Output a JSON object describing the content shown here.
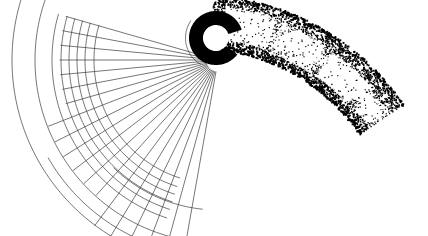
{
  "figure": {
    "title": "Curved grid and stippled band diagram",
    "canvas": {
      "width": 428,
      "height": 236,
      "background": "#ffffff"
    },
    "caption": "",
    "palette": {
      "ink": "#000000",
      "line": "#3b3b3b",
      "background": "#ffffff",
      "stipple": "#000000"
    }
  },
  "annulus": {
    "name": "black ring with gap",
    "center_x": 216,
    "center_y": 38,
    "outer_radius": 27,
    "inner_radius": 13,
    "gap_start_deg": -18,
    "gap_end_deg": 38,
    "fill": "#000000",
    "hole_fill": "#ffffff"
  },
  "grid": {
    "name": "polar mesh of arcs and radial lines",
    "center_x": 218,
    "center_y": 60,
    "arc_radii": [
      124,
      133,
      141,
      149,
      157,
      166,
      183,
      206
    ],
    "arc_start_deg": 108,
    "arc_end_deg": 196,
    "radial_count": 19,
    "radial_start_deg": 100,
    "radial_end_deg": 196,
    "radial_inner_radius": 8,
    "radial_outer_radius": 208,
    "stroke": "#3b3b3b",
    "stroke_width": 0.7
  },
  "band": {
    "name": "stippled curved band",
    "center_x": 196,
    "center_y": 244,
    "inner_radius": 196,
    "outer_radius": 250,
    "start_deg": -86,
    "end_deg": -34,
    "dot_count": 5200,
    "dot_min_size": 0.8,
    "dot_max_size": 1.9,
    "edge_density_boost": 2.4,
    "panels": [
      {
        "label": "panel-1",
        "a0": -82.5,
        "a1": -70.5,
        "r0": 0.2,
        "r1": 0.78
      },
      {
        "label": "panel-2",
        "a0": -68.5,
        "a1": -57.0,
        "r0": 0.18,
        "r1": 0.74
      },
      {
        "label": "panel-3",
        "a0": -54.5,
        "a1": -43.0,
        "r0": 0.2,
        "r1": 0.72
      },
      {
        "label": "panel-4",
        "a0": -41.0,
        "a1": -35.5,
        "r0": 0.24,
        "r1": 0.62
      }
    ]
  },
  "labels": {
    "figure_label": "",
    "axis_note": ""
  }
}
